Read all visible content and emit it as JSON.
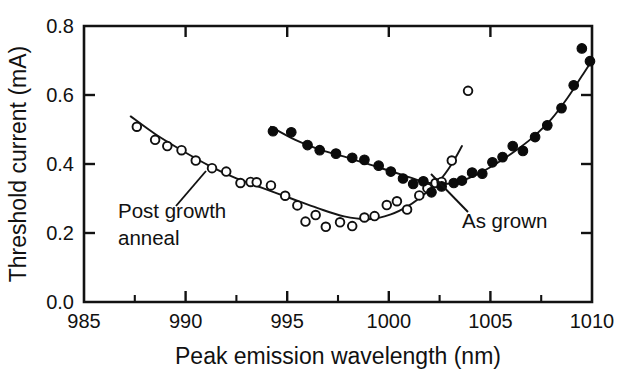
{
  "chart_data": {
    "type": "scatter",
    "title": "",
    "xlabel": "Peak emission wavelength (nm)",
    "ylabel": "Threshold current (mA)",
    "xlim": [
      985,
      1010
    ],
    "ylim": [
      0.0,
      0.8
    ],
    "xticks": [
      985,
      990,
      995,
      1000,
      1005,
      1010
    ],
    "xtick_labels": [
      "985",
      "990",
      "995",
      "1000",
      "1005",
      "1010"
    ],
    "xminor_ticks": [
      987.5,
      992.5,
      997.5,
      1002.5,
      1007.5
    ],
    "yticks": [
      0.0,
      0.2,
      0.4,
      0.6,
      0.8
    ],
    "ytick_labels": [
      "0.0",
      "0.2",
      "0.4",
      "0.6",
      "0.8"
    ],
    "grid": false,
    "legend_position": "inline-annotations",
    "series": [
      {
        "name": "Post growth anneal",
        "marker": "open-circle",
        "marker_color": "#ffffff",
        "edge_color": "#101010",
        "points": [
          [
            987.6,
            0.508
          ],
          [
            988.5,
            0.47
          ],
          [
            989.1,
            0.452
          ],
          [
            989.8,
            0.44
          ],
          [
            990.5,
            0.41
          ],
          [
            991.3,
            0.388
          ],
          [
            992.0,
            0.378
          ],
          [
            992.7,
            0.345
          ],
          [
            993.2,
            0.348
          ],
          [
            993.5,
            0.347
          ],
          [
            994.2,
            0.338
          ],
          [
            994.9,
            0.308
          ],
          [
            995.5,
            0.28
          ],
          [
            995.9,
            0.233
          ],
          [
            996.4,
            0.252
          ],
          [
            996.9,
            0.218
          ],
          [
            997.6,
            0.231
          ],
          [
            998.2,
            0.22
          ],
          [
            998.8,
            0.245
          ],
          [
            999.3,
            0.249
          ],
          [
            999.9,
            0.281
          ],
          [
            1000.4,
            0.292
          ],
          [
            1000.9,
            0.268
          ],
          [
            1001.5,
            0.309
          ],
          [
            1001.9,
            0.33
          ],
          [
            1002.3,
            0.345
          ],
          [
            1002.6,
            0.348
          ],
          [
            1003.1,
            0.41
          ],
          [
            1003.9,
            0.612
          ]
        ],
        "fit_curve": [
          [
            987.3,
            0.538
          ],
          [
            988.5,
            0.487
          ],
          [
            989.8,
            0.44
          ],
          [
            991.2,
            0.394
          ],
          [
            992.5,
            0.358
          ],
          [
            993.8,
            0.33
          ],
          [
            995.2,
            0.3
          ],
          [
            996.5,
            0.272
          ],
          [
            997.8,
            0.248
          ],
          [
            999.0,
            0.24
          ],
          [
            1000.1,
            0.254
          ],
          [
            1001.0,
            0.28
          ],
          [
            1001.8,
            0.315
          ],
          [
            1002.5,
            0.352
          ],
          [
            1003.1,
            0.4
          ],
          [
            1003.6,
            0.452
          ]
        ]
      },
      {
        "name": "As grown",
        "marker": "filled-circle",
        "marker_color": "#0b0b0b",
        "edge_color": "#0b0b0b",
        "points": [
          [
            994.3,
            0.495
          ],
          [
            995.2,
            0.492
          ],
          [
            996.0,
            0.455
          ],
          [
            996.6,
            0.44
          ],
          [
            997.4,
            0.43
          ],
          [
            998.2,
            0.418
          ],
          [
            998.8,
            0.412
          ],
          [
            999.5,
            0.395
          ],
          [
            1000.1,
            0.378
          ],
          [
            1000.7,
            0.358
          ],
          [
            1001.2,
            0.342
          ],
          [
            1001.7,
            0.35
          ],
          [
            1002.1,
            0.318
          ],
          [
            1002.6,
            0.335
          ],
          [
            1003.2,
            0.345
          ],
          [
            1003.6,
            0.352
          ],
          [
            1004.1,
            0.375
          ],
          [
            1004.6,
            0.372
          ],
          [
            1005.1,
            0.405
          ],
          [
            1005.6,
            0.42
          ],
          [
            1006.1,
            0.452
          ],
          [
            1006.6,
            0.438
          ],
          [
            1007.2,
            0.478
          ],
          [
            1007.8,
            0.512
          ],
          [
            1008.5,
            0.562
          ],
          [
            1009.1,
            0.628
          ],
          [
            1009.5,
            0.735
          ],
          [
            1009.9,
            0.698
          ]
        ],
        "fit_curve": [
          [
            994.2,
            0.508
          ],
          [
            995.4,
            0.47
          ],
          [
            996.7,
            0.44
          ],
          [
            998.0,
            0.418
          ],
          [
            999.4,
            0.392
          ],
          [
            1000.7,
            0.368
          ],
          [
            1002.0,
            0.345
          ],
          [
            1003.2,
            0.345
          ],
          [
            1004.2,
            0.366
          ],
          [
            1005.2,
            0.398
          ],
          [
            1006.2,
            0.437
          ],
          [
            1007.1,
            0.478
          ],
          [
            1008.0,
            0.53
          ],
          [
            1008.8,
            0.592
          ],
          [
            1009.5,
            0.655
          ],
          [
            1010.0,
            0.7
          ]
        ]
      }
    ],
    "annotations": [
      {
        "text_line1": "Post growth",
        "text_line2": "anneal",
        "text_x": 118,
        "text_y": 218,
        "leader_from": [
          176,
          206
        ],
        "leader_to": [
          206,
          171
        ]
      },
      {
        "text_line1": "As grown",
        "text_line2": "",
        "text_x": 462,
        "text_y": 228,
        "leader_from": [
          468,
          212
        ],
        "leader_to": [
          431,
          174
        ]
      }
    ]
  },
  "figure": {
    "caption": ""
  }
}
